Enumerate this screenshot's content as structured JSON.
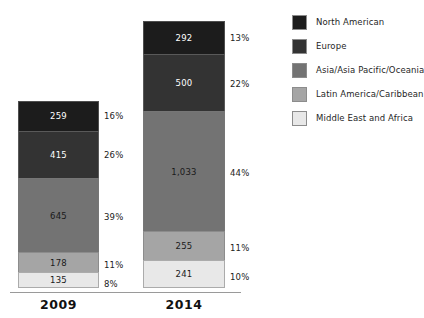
{
  "chart_data": {
    "type": "bar",
    "subtype": "stacked-vertical",
    "title": "",
    "xlabel": "",
    "ylabel": "",
    "grid": false,
    "legend_position": "right",
    "categories": [
      "2009",
      "2014"
    ],
    "series": [
      {
        "name": "North American",
        "color": "#1c1c1c",
        "values": [
          259,
          292
        ],
        "value_labels": [
          "259",
          "292"
        ],
        "percent_labels": [
          "16%",
          "22%"
        ]
      },
      {
        "name": "Europe",
        "color": "#333333",
        "values": [
          415,
          500
        ],
        "value_labels": [
          "415",
          "500"
        ],
        "percent_labels": [
          "26%",
          "22%"
        ]
      },
      {
        "name": "Asia/Asia Pacific/Oceania",
        "color": "#737373",
        "values": [
          645,
          1033
        ],
        "value_labels": [
          "645",
          "1,033"
        ],
        "percent_labels": [
          "39%",
          "44%"
        ]
      },
      {
        "name": "Latin America/Caribbean",
        "color": "#a5a5a5",
        "values": [
          178,
          255
        ],
        "value_labels": [
          "178",
          "255"
        ],
        "percent_labels": [
          "11%",
          "11%"
        ]
      },
      {
        "name": "Middle East and Africa",
        "color": "#e8e8e8",
        "values": [
          135,
          241
        ],
        "value_labels": [
          "135",
          "241"
        ],
        "percent_labels": [
          "8%",
          "10%"
        ]
      }
    ],
    "bars": [
      {
        "category": "2009",
        "total": 1632,
        "segments": [
          {
            "name": "North American",
            "value": 259,
            "value_label": "259",
            "percent_label": "16%",
            "color": "#1c1c1c",
            "text_color": "#ffffff"
          },
          {
            "name": "Europe",
            "value": 415,
            "value_label": "415",
            "percent_label": "26%",
            "color": "#333333",
            "text_color": "#ffffff"
          },
          {
            "name": "Asia/Asia Pacific/Oceania",
            "value": 645,
            "value_label": "645",
            "percent_label": "39%",
            "color": "#737373",
            "text_color": "#1a1a1a"
          },
          {
            "name": "Latin America/Caribbean",
            "value": 178,
            "value_label": "178",
            "percent_label": "11%",
            "color": "#a5a5a5",
            "text_color": "#1a1a1a"
          },
          {
            "name": "Middle East and Africa",
            "value": 135,
            "value_label": "135",
            "percent_label": "8%",
            "color": "#e8e8e8",
            "text_color": "#1a1a1a"
          }
        ]
      },
      {
        "category": "2014",
        "total": 2321,
        "segments": [
          {
            "name": "North American",
            "value": 292,
            "value_label": "292",
            "percent_label": "13%",
            "color": "#1c1c1c",
            "text_color": "#ffffff"
          },
          {
            "name": "Europe",
            "value": 500,
            "value_label": "500",
            "percent_label": "22%",
            "color": "#333333",
            "text_color": "#ffffff"
          },
          {
            "name": "Asia/Asia Pacific/Oceania",
            "value": 1033,
            "value_label": "1,033",
            "percent_label": "44%",
            "color": "#737373",
            "text_color": "#1a1a1a"
          },
          {
            "name": "Latin America/Caribbean",
            "value": 255,
            "value_label": "255",
            "percent_label": "11%",
            "color": "#a5a5a5",
            "text_color": "#1a1a1a"
          },
          {
            "name": "Middle East and Africa",
            "value": 241,
            "value_label": "241",
            "percent_label": "10%",
            "color": "#e8e8e8",
            "text_color": "#1a1a1a"
          }
        ]
      }
    ],
    "legend": [
      {
        "label": "North American",
        "color": "#1c1c1c"
      },
      {
        "label": "Europe",
        "color": "#333333"
      },
      {
        "label": "Asia/Asia Pacific/Oceania",
        "color": "#737373"
      },
      {
        "label": "Latin America/Caribbean",
        "color": "#a5a5a5"
      },
      {
        "label": "Middle East and Africa",
        "color": "#e8e8e8"
      }
    ],
    "axis_color": "#9a9a9a"
  }
}
